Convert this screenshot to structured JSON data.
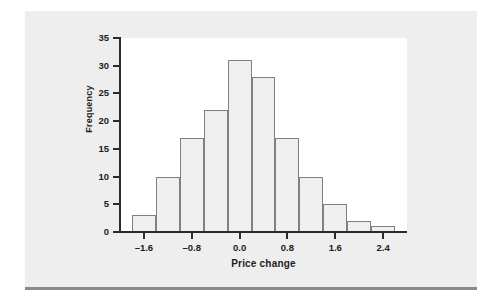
{
  "figure": {
    "panel_color": "#eeeeee",
    "canvas_color": "#ffffff",
    "rule_color": "#8a8a8a"
  },
  "chart_data": {
    "type": "bar",
    "subtype": "histogram",
    "title": "",
    "xlabel": "Price change",
    "ylabel": "Frequency",
    "bin_width": 0.4,
    "bin_edges": [
      -1.8,
      -1.4,
      -1.0,
      -0.6,
      -0.2,
      0.2,
      0.6,
      1.0,
      1.4,
      1.8,
      2.2,
      2.6
    ],
    "bin_centers": [
      -1.6,
      -1.2,
      -0.8,
      -0.4,
      0.0,
      0.4,
      0.8,
      1.2,
      1.6,
      2.0,
      2.4
    ],
    "categories": [
      "-1.8 to -1.4",
      "-1.4 to -1.0",
      "-1.0 to -0.6",
      "-0.6 to -0.2",
      "-0.2 to 0.2",
      "0.2 to 0.6",
      "0.6 to 1.0",
      "1.0 to 1.4",
      "1.4 to 1.8",
      "1.8 to 2.2",
      "2.2 to 2.6"
    ],
    "values": [
      3,
      10,
      17,
      22,
      31,
      28,
      17,
      10,
      5,
      2,
      1
    ],
    "xlim": [
      -2.0,
      2.8
    ],
    "ylim": [
      0,
      35
    ],
    "xticks": [
      -1.6,
      -0.8,
      0.0,
      0.8,
      1.6,
      2.4
    ],
    "xtick_labels": [
      "–1.6",
      "–0.8",
      "0.0",
      "0.8",
      "1.6",
      "2.4"
    ],
    "yticks": [
      0,
      5,
      10,
      15,
      20,
      25,
      30,
      35
    ],
    "ytick_labels": [
      "0",
      "5",
      "10",
      "15",
      "20",
      "25",
      "30",
      "35"
    ],
    "grid": false,
    "legend": false,
    "bar_fill": "#efefef",
    "bar_edge": "#808080",
    "axis_color": "#2b2b2b",
    "total_count": 146
  }
}
